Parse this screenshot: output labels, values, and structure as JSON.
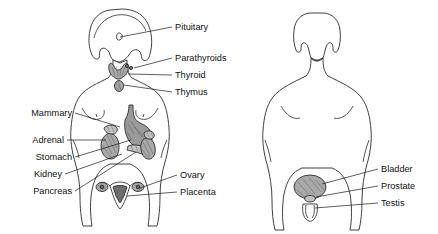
{
  "figure": {
    "background_color": "#ffffff",
    "line_color": "#2b2b2b",
    "organ_fill": "#a9a9a9",
    "text_color": "#111111",
    "width": 438,
    "height": 234
  },
  "female_figure": {
    "name": "female-body-anterior-view",
    "labels_left": [
      {
        "text": "Mammary",
        "x": 72,
        "y": 116,
        "leader_from": [
          75,
          113
        ],
        "leader_to": [
          122,
          126
        ]
      },
      {
        "text": "Adrenal",
        "x": 64,
        "y": 143,
        "leader_from": [
          67,
          140
        ],
        "leader_to": [
          108,
          140
        ]
      },
      {
        "text": "Stomach",
        "x": 72,
        "y": 160,
        "leader_from": [
          75,
          157
        ],
        "leader_to": [
          131,
          140
        ]
      },
      {
        "text": "Kidney",
        "x": 62,
        "y": 177,
        "leader_from": [
          65,
          174
        ],
        "leader_to": [
          122,
          153
        ]
      },
      {
        "text": "Pancreas",
        "x": 72,
        "y": 194,
        "leader_from": [
          75,
          191
        ],
        "leader_to": [
          136,
          153
        ]
      }
    ],
    "labels_right": [
      {
        "text": "Pituitary",
        "x": 175,
        "y": 30,
        "leader_from": [
          172,
          27
        ],
        "leader_to": [
          120,
          37
        ]
      },
      {
        "text": "Parathyroids",
        "x": 175,
        "y": 61,
        "leader_from": [
          172,
          58
        ],
        "leader_to": [
          143,
          68
        ]
      },
      {
        "text": "Thyroid",
        "x": 175,
        "y": 78,
        "leader_from": [
          172,
          75
        ],
        "leader_to": [
          128,
          74
        ]
      },
      {
        "text": "Thymus",
        "x": 175,
        "y": 95,
        "leader_from": [
          172,
          92
        ],
        "leader_to": [
          126,
          84
        ]
      },
      {
        "text": "Ovary",
        "x": 180,
        "y": 178,
        "leader_from": [
          177,
          175
        ],
        "leader_to": [
          139,
          188
        ]
      },
      {
        "text": "Placenta",
        "x": 180,
        "y": 195,
        "leader_from": [
          177,
          192
        ],
        "leader_to": [
          131,
          193
        ]
      }
    ],
    "organs": [
      "pituitary",
      "thyroid",
      "parathyroids",
      "thymus",
      "mammary",
      "adrenal",
      "stomach",
      "kidney",
      "pancreas",
      "ovary",
      "uterus-placenta"
    ]
  },
  "male_figure": {
    "name": "male-body-anterior-view",
    "labels_right": [
      {
        "text": "Bladder",
        "x": 381,
        "y": 172,
        "leader_from": [
          378,
          169
        ],
        "leader_to": [
          322,
          184
        ]
      },
      {
        "text": "Prostate",
        "x": 381,
        "y": 189,
        "leader_from": [
          378,
          186
        ],
        "leader_to": [
          314,
          196
        ]
      },
      {
        "text": "Testis",
        "x": 381,
        "y": 206,
        "leader_from": [
          378,
          203
        ],
        "leader_to": [
          314,
          207
        ]
      }
    ],
    "organs": [
      "bladder",
      "prostate",
      "testis"
    ]
  }
}
